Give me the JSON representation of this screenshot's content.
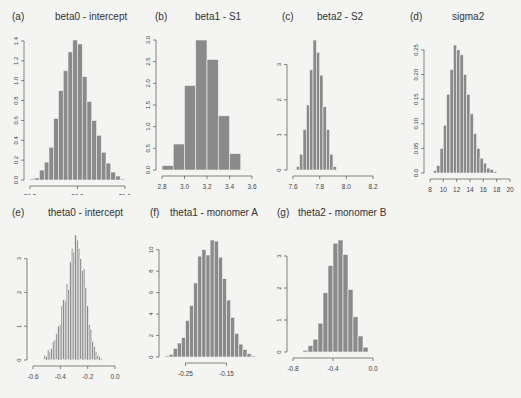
{
  "chart_data": [
    {
      "type": "bar",
      "id": "a",
      "label": "(a)",
      "title": "beta0 - intercept",
      "xlabel": "",
      "ylabel": "",
      "xlim": [
        29.5,
        31.5
      ],
      "ylim": [
        0,
        1.4
      ],
      "xticks": [
        "29.5",
        "30.5",
        "31.5"
      ],
      "xtick_values": [
        29.5,
        30.5,
        31.5
      ],
      "yticks": [
        "0.0",
        "0.2",
        "0.4",
        "0.6",
        "0.8",
        "1.0",
        "1.2",
        "1.4"
      ],
      "ytick_values": [
        0,
        0.2,
        0.4,
        0.6,
        0.8,
        1.0,
        1.2,
        1.4
      ],
      "bin_start": 29.5,
      "bin_width": 0.1,
      "values": [
        0.01,
        0.02,
        0.1,
        0.18,
        0.33,
        0.62,
        0.9,
        1.1,
        1.29,
        1.41,
        1.37,
        1.04,
        0.79,
        0.6,
        0.45,
        0.28,
        0.17,
        0.08,
        0.04,
        0.01
      ],
      "grid": false
    },
    {
      "type": "bar",
      "id": "b",
      "label": "(b)",
      "title": "beta1 - S1",
      "xlabel": "",
      "ylabel": "",
      "xlim": [
        2.8,
        3.6
      ],
      "ylim": [
        0,
        3.0
      ],
      "xticks": [
        "2.8",
        "3.0",
        "3.2",
        "3.4",
        "3.6"
      ],
      "xtick_values": [
        2.8,
        3.0,
        3.2,
        3.4,
        3.6
      ],
      "yticks": [
        "0.0",
        "0.5",
        "1.0",
        "1.5",
        "2.0",
        "2.5",
        "3.0"
      ],
      "ytick_values": [
        0,
        0.5,
        1.0,
        1.5,
        2.0,
        2.5,
        3.0
      ],
      "bin_start": 2.8,
      "bin_width": 0.1,
      "values": [
        0.1,
        0.6,
        1.95,
        3.0,
        2.55,
        1.25,
        0.38,
        0.01
      ],
      "grid": false
    },
    {
      "type": "bar",
      "id": "c",
      "label": "(c)",
      "title": "beta2 - S2",
      "xlabel": "",
      "ylabel": "",
      "xlim": [
        7.6,
        8.2
      ],
      "ylim": [
        0,
        3.0
      ],
      "xticks": [
        "7.6",
        "7.8",
        "8.0",
        "8.2"
      ],
      "xtick_values": [
        7.6,
        7.8,
        8.0,
        8.2
      ],
      "yticks": [
        "0",
        "1",
        "2",
        "3"
      ],
      "ytick_values": [
        0,
        1,
        2,
        3
      ],
      "bin_start": 7.6,
      "bin_width": 0.025,
      "values": [
        0.02,
        0.1,
        0.45,
        1.15,
        1.85,
        2.85,
        3.7,
        3.35,
        2.7,
        1.8,
        1.15,
        0.45,
        0.1
      ],
      "grid": false
    },
    {
      "type": "bar",
      "id": "d",
      "label": "(d)",
      "title": "sigma2",
      "xlabel": "",
      "ylabel": "",
      "xlim": [
        8,
        20
      ],
      "ylim": [
        0,
        0.25
      ],
      "xticks": [
        "8",
        "10",
        "12",
        "14",
        "16",
        "18",
        "20"
      ],
      "xtick_values": [
        8,
        10,
        12,
        14,
        16,
        18,
        20
      ],
      "yticks": [
        "0.0",
        "0.05",
        "0.10",
        "0.15",
        "0.20",
        "0.25"
      ],
      "ytick_values": [
        0,
        0.05,
        0.1,
        0.15,
        0.2,
        0.25
      ],
      "bin_start": 8.5,
      "bin_width": 0.5,
      "values": [
        0.005,
        0.015,
        0.05,
        0.097,
        0.16,
        0.21,
        0.26,
        0.25,
        0.24,
        0.2,
        0.16,
        0.12,
        0.08,
        0.05,
        0.03,
        0.02,
        0.01,
        0.007,
        0.003
      ],
      "grid": false
    },
    {
      "type": "bar",
      "id": "e",
      "label": "(e)",
      "title": "theta0 - intercept",
      "xlabel": "",
      "ylabel": "",
      "xlim": [
        -0.6,
        0.0
      ],
      "ylim": [
        0,
        3
      ],
      "xticks": [
        "-0.6",
        "-0.4",
        "-0.2",
        "0.0"
      ],
      "xtick_values": [
        -0.6,
        -0.4,
        -0.2,
        0.0
      ],
      "yticks": [
        "0",
        "1",
        "2",
        "3"
      ],
      "ytick_values": [
        0,
        1,
        2,
        3
      ],
      "bin_start": -0.52,
      "bin_width": 0.0125,
      "values": [
        0.15,
        0.1,
        0.3,
        0.25,
        0.35,
        0.55,
        0.6,
        0.8,
        1.0,
        1.05,
        1.6,
        1.8,
        1.75,
        2.25,
        2.1,
        2.9,
        3.3,
        3.2,
        3.7,
        3.55,
        3.3,
        3.0,
        2.65,
        2.7,
        2.15,
        1.6,
        1.05,
        0.9,
        0.55,
        0.4,
        0.25,
        0.15,
        0.1,
        0.05
      ],
      "grid": false
    },
    {
      "type": "bar",
      "id": "f",
      "label": "(f)",
      "title": "theta1 - monomer A",
      "xlabel": "",
      "ylabel": "",
      "xlim": [
        -0.3,
        -0.1
      ],
      "ylim": [
        0,
        10
      ],
      "xticks": [
        "-0.25",
        "-0.15"
      ],
      "xtick_values": [
        -0.25,
        -0.15
      ],
      "yticks": [
        "0",
        "2",
        "4",
        "6",
        "8",
        "10"
      ],
      "ytick_values": [
        0,
        2,
        4,
        6,
        8,
        10
      ],
      "bin_start": -0.3,
      "bin_width": 0.01,
      "values": [
        0.1,
        0.25,
        0.8,
        1.3,
        1.8,
        3.4,
        4.8,
        6.9,
        9.4,
        10.0,
        9.5,
        10.9,
        10.8,
        9.3,
        7.3,
        5.3,
        3.7,
        2.2,
        1.2,
        0.7,
        0.3,
        0.1
      ],
      "grid": false
    },
    {
      "type": "bar",
      "id": "g",
      "label": "(g)",
      "title": "theta2 - monomer B",
      "xlabel": "",
      "ylabel": "",
      "xlim": [
        -0.8,
        0.0
      ],
      "ylim": [
        0,
        3
      ],
      "xticks": [
        "-0.8",
        "-0.4",
        "0.0"
      ],
      "xtick_values": [
        -0.8,
        -0.4,
        0.0
      ],
      "yticks": [
        "0",
        "1",
        "2",
        "3"
      ],
      "ytick_values": [
        0,
        1,
        2,
        3
      ],
      "bin_start": -0.7,
      "bin_width": 0.05,
      "values": [
        0.05,
        0.2,
        0.4,
        0.9,
        1.85,
        2.7,
        3.4,
        3.5,
        3.05,
        1.95,
        1.1,
        0.5,
        0.15
      ],
      "grid": false
    }
  ],
  "panels": [
    {
      "label": "(a)",
      "title": "beta0 - intercept"
    },
    {
      "label": "(b)",
      "title": "beta1 - S1"
    },
    {
      "label": "(c)",
      "title": "beta2 - S2"
    },
    {
      "label": "(d)",
      "title": "sigma2"
    },
    {
      "label": "(e)",
      "title": "theta0 - intercept"
    },
    {
      "label": "(f)",
      "title": "theta1 - monomer A"
    },
    {
      "label": "(g)",
      "title": "theta2 - monomer B"
    }
  ],
  "style": {
    "bar_fill": "#8a8a8a",
    "bar_stroke": "#f0f0ee",
    "axis_color": "#666666",
    "background": "#f4f4f2"
  }
}
